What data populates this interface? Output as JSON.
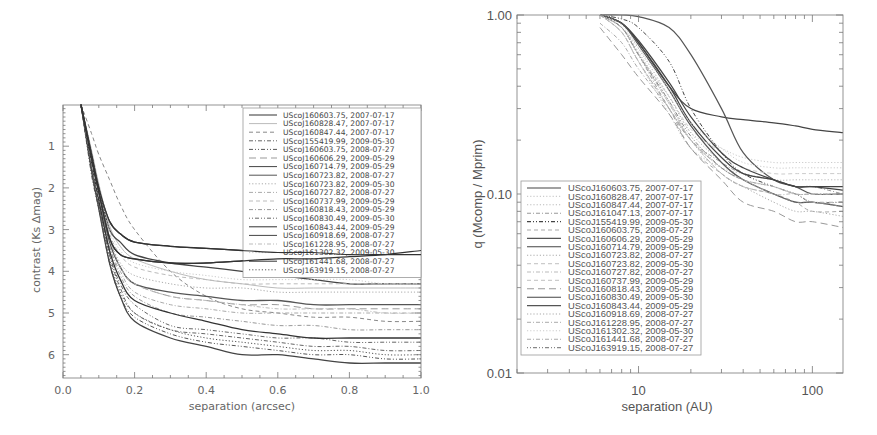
{
  "chart_data": [
    {
      "type": "line",
      "title": "",
      "xlabel": "separation (arcsec)",
      "ylabel": "contrast (Ks Δmag)",
      "xlim": [
        0.0,
        1.0
      ],
      "ylim": [
        6.5,
        0.0
      ],
      "y_inverted": true,
      "xticks": [
        "0.0",
        "0.2",
        "0.4",
        "0.6",
        "0.8",
        "1.0"
      ],
      "yticks": [
        "1",
        "2",
        "3",
        "4",
        "5",
        "6"
      ],
      "legend_position": "upper right",
      "x": [
        0.05,
        0.08,
        0.1,
        0.13,
        0.16,
        0.2,
        0.3,
        0.4,
        0.5,
        0.6,
        0.7,
        0.8,
        0.9,
        1.0
      ],
      "series": [
        {
          "name": "UScoJ160603.75, 2007-07-17",
          "style": "solid",
          "color": "#333333",
          "values": [
            0.0,
            1.2,
            2.0,
            2.8,
            3.1,
            3.3,
            3.4,
            3.45,
            3.5,
            3.55,
            3.55,
            3.6,
            3.6,
            3.6
          ]
        },
        {
          "name": "UScoJ160828.47, 2007-07-17",
          "style": "solid-light",
          "color": "#bbbbbb",
          "values": [
            0.0,
            1.1,
            1.9,
            2.9,
            3.4,
            3.7,
            4.0,
            4.2,
            4.3,
            4.4,
            4.4,
            4.4,
            4.4,
            4.4
          ]
        },
        {
          "name": "UScoJ160847.44, 2007-07-17",
          "style": "dashed",
          "color": "#888888",
          "values": [
            0.0,
            0.7,
            1.2,
            1.8,
            2.4,
            3.0,
            4.0,
            4.6,
            4.9,
            5.0,
            5.1,
            5.1,
            5.2,
            5.2
          ]
        },
        {
          "name": "UScoJ155419.99, 2009-05-30",
          "style": "dash-dot",
          "color": "#666666",
          "values": [
            0.0,
            1.6,
            2.4,
            3.6,
            4.4,
            5.0,
            5.4,
            5.5,
            5.6,
            5.7,
            5.8,
            5.8,
            5.9,
            5.9
          ]
        },
        {
          "name": "UScoJ160603.75, 2008-07-27",
          "style": "dash-dot-dot",
          "color": "#555555",
          "values": [
            0.0,
            1.7,
            2.5,
            3.8,
            4.6,
            5.1,
            5.5,
            5.7,
            5.8,
            5.9,
            6.0,
            6.0,
            6.1,
            6.1
          ]
        },
        {
          "name": "UScoJ160606.29, 2009-05-29",
          "style": "long-dash",
          "color": "#999999",
          "values": [
            0.0,
            1.3,
            2.1,
            3.2,
            3.9,
            4.3,
            4.6,
            4.7,
            4.8,
            4.8,
            4.9,
            4.9,
            4.9,
            4.9
          ]
        },
        {
          "name": "UScoJ160714.79, 2009-05-29",
          "style": "solid",
          "color": "#444444",
          "values": [
            0.0,
            1.2,
            2.0,
            3.0,
            3.3,
            3.6,
            3.8,
            3.9,
            4.0,
            4.1,
            4.2,
            4.3,
            4.3,
            4.3
          ]
        },
        {
          "name": "UScoJ160723.82, 2008-07-27",
          "style": "solid",
          "color": "#555555",
          "values": [
            0.0,
            1.3,
            2.2,
            3.3,
            3.9,
            4.3,
            4.5,
            4.6,
            4.7,
            4.7,
            4.8,
            4.8,
            4.8,
            4.8
          ]
        },
        {
          "name": "UScoJ160723.82, 2009-05-30",
          "style": "dotted",
          "color": "#aaaaaa",
          "values": [
            0.0,
            1.3,
            2.2,
            3.2,
            3.8,
            4.1,
            4.3,
            4.4,
            4.4,
            4.5,
            4.5,
            4.5,
            4.5,
            4.5
          ]
        },
        {
          "name": "UScoJ160727.82, 2008-07-27",
          "style": "dash-dot",
          "color": "#aaaaaa",
          "values": [
            0.0,
            1.4,
            2.3,
            3.4,
            4.0,
            4.5,
            4.8,
            4.9,
            5.0,
            5.0,
            5.0,
            5.0,
            5.0,
            5.0
          ]
        },
        {
          "name": "UScoJ160737.99, 2009-05-29",
          "style": "dashed",
          "color": "#bbbbbb",
          "values": [
            0.0,
            1.3,
            2.1,
            3.1,
            3.6,
            3.9,
            4.1,
            4.2,
            4.3,
            4.3,
            4.3,
            4.3,
            4.3,
            4.3
          ]
        },
        {
          "name": "UScoJ160818.43, 2009-05-29",
          "style": "dash-dot",
          "color": "#999999",
          "values": [
            0.0,
            1.4,
            2.3,
            3.4,
            4.1,
            4.6,
            5.0,
            5.1,
            5.2,
            5.3,
            5.3,
            5.4,
            5.4,
            5.4
          ]
        },
        {
          "name": "UScoJ160830.49, 2009-05-30",
          "style": "dotted-dashed",
          "color": "#666666",
          "values": [
            0.0,
            1.5,
            2.4,
            3.6,
            4.3,
            4.8,
            5.3,
            5.4,
            5.5,
            5.6,
            5.6,
            5.7,
            5.7,
            5.7
          ]
        },
        {
          "name": "UScoJ160843.44, 2009-05-29",
          "style": "solid",
          "color": "#333333",
          "values": [
            0.0,
            1.4,
            2.3,
            3.5,
            4.2,
            4.7,
            5.0,
            5.2,
            5.4,
            5.5,
            5.6,
            5.6,
            5.6,
            5.6
          ]
        },
        {
          "name": "UScoJ160918.69, 2008-07-27",
          "style": "solid",
          "color": "#444444",
          "values": [
            0.0,
            1.6,
            2.5,
            3.8,
            4.6,
            5.2,
            5.6,
            5.8,
            6.0,
            6.0,
            6.1,
            6.2,
            6.2,
            6.2
          ]
        },
        {
          "name": "UScoJ161228.95, 2008-07-27",
          "style": "dash-dot",
          "color": "#bbbbbb",
          "values": [
            0.0,
            1.4,
            2.2,
            3.2,
            3.9,
            4.3,
            4.6,
            4.7,
            4.8,
            4.9,
            4.9,
            4.9,
            5.0,
            5.0
          ]
        },
        {
          "name": "UScoJ161302.32, 2009-05-30",
          "style": "dotted",
          "color": "#cccccc",
          "values": [
            0.0,
            1.2,
            2.0,
            3.0,
            3.5,
            3.8,
            4.0,
            4.1,
            4.2,
            4.2,
            4.2,
            4.2,
            4.3,
            4.3
          ]
        },
        {
          "name": "UScoJ161441.68, 2008-07-27",
          "style": "solid",
          "color": "#333333",
          "values": [
            0.0,
            1.3,
            2.1,
            3.2,
            3.6,
            3.7,
            3.8,
            3.8,
            3.75,
            3.7,
            3.7,
            3.65,
            3.6,
            3.5
          ]
        },
        {
          "name": "UScoJ163919.15, 2008-07-27",
          "style": "dotted",
          "color": "#555555",
          "values": [
            0.0,
            1.6,
            2.5,
            3.7,
            4.5,
            5.0,
            5.4,
            5.6,
            5.7,
            5.8,
            5.9,
            5.9,
            6.0,
            6.0
          ]
        }
      ]
    },
    {
      "type": "line",
      "title": "",
      "xlabel": "separation (AU)",
      "ylabel": "q (Mcomp / Mprim)",
      "xscale": "log",
      "yscale": "log",
      "xlim": [
        2,
        150
      ],
      "ylim": [
        0.01,
        1.0
      ],
      "xticks": [
        "10",
        "100"
      ],
      "yticks": [
        "0.01",
        "0.10",
        "1.00"
      ],
      "legend_position": "lower left",
      "x": [
        6,
        8,
        10,
        15,
        20,
        30,
        40,
        60,
        80,
        100,
        150
      ],
      "series": [
        {
          "name": "UScoJ160603.75, 2007-07-17",
          "style": "solid",
          "color": "#444444",
          "values": [
            1.0,
            0.9,
            0.7,
            0.4,
            0.3,
            0.27,
            0.26,
            0.25,
            0.24,
            0.23,
            0.22
          ]
        },
        {
          "name": "UScoJ160828.47, 2007-07-17",
          "style": "dotted",
          "color": "#cccccc",
          "values": [
            1.0,
            0.85,
            0.6,
            0.35,
            0.22,
            0.18,
            0.16,
            0.15,
            0.15,
            0.15,
            0.15
          ]
        },
        {
          "name": "UScoJ160847.44, 2007-07-17",
          "style": "dotted",
          "color": "#bbbbbb",
          "values": [
            1.0,
            0.8,
            0.55,
            0.28,
            0.18,
            0.14,
            0.13,
            0.12,
            0.12,
            0.12,
            0.12
          ]
        },
        {
          "name": "UScoJ161047.13, 2007-07-17",
          "style": "dash-dot",
          "color": "#999999",
          "values": [
            1.0,
            0.85,
            0.6,
            0.3,
            0.2,
            0.15,
            0.13,
            0.12,
            0.11,
            0.11,
            0.1
          ]
        },
        {
          "name": "UScoJ155419.99, 2009-05-30",
          "style": "dash-dot-dot",
          "color": "#444444",
          "values": [
            1.0,
            0.95,
            0.85,
            0.55,
            0.3,
            0.17,
            0.13,
            0.11,
            0.1,
            0.09,
            0.09
          ]
        },
        {
          "name": "UScoJ160603.75, 2008-07-27",
          "style": "dashed",
          "color": "#aaaaaa",
          "values": [
            1.0,
            0.8,
            0.55,
            0.3,
            0.18,
            0.13,
            0.11,
            0.1,
            0.09,
            0.08,
            0.08
          ]
        },
        {
          "name": "UScoJ160606.29, 2009-05-29",
          "style": "solid",
          "color": "#555555",
          "values": [
            1.0,
            1.0,
            0.98,
            0.85,
            0.6,
            0.3,
            0.17,
            0.12,
            0.11,
            0.1,
            0.1
          ]
        },
        {
          "name": "UScoJ160714.79, 2009-05-29",
          "style": "solid",
          "color": "#444444",
          "values": [
            1.0,
            0.9,
            0.7,
            0.4,
            0.25,
            0.16,
            0.13,
            0.12,
            0.11,
            0.11,
            0.11
          ]
        },
        {
          "name": "UScoJ160723.82, 2008-07-27",
          "style": "dotted",
          "color": "#aaaaaa",
          "values": [
            1.0,
            0.85,
            0.65,
            0.35,
            0.22,
            0.15,
            0.12,
            0.11,
            0.1,
            0.1,
            0.1
          ]
        },
        {
          "name": "UScoJ160723.82, 2009-05-30",
          "style": "dashed",
          "color": "#cccccc",
          "values": [
            1.0,
            0.85,
            0.6,
            0.32,
            0.2,
            0.14,
            0.12,
            0.11,
            0.1,
            0.1,
            0.1
          ]
        },
        {
          "name": "UScoJ160727.82, 2008-07-27",
          "style": "dash-dot",
          "color": "#bbbbbb",
          "values": [
            1.0,
            0.8,
            0.55,
            0.3,
            0.2,
            0.13,
            0.11,
            0.1,
            0.09,
            0.09,
            0.09
          ]
        },
        {
          "name": "UScoJ160737.99, 2009-05-29",
          "style": "dashed",
          "color": "#cccccc",
          "values": [
            1.0,
            0.85,
            0.6,
            0.35,
            0.23,
            0.17,
            0.14,
            0.13,
            0.13,
            0.13,
            0.13
          ]
        },
        {
          "name": "UScoJ160818.43, 2009-05-29",
          "style": "long-dash",
          "color": "#999999",
          "values": [
            0.85,
            0.6,
            0.45,
            0.28,
            0.18,
            0.12,
            0.09,
            0.08,
            0.07,
            0.07,
            0.065
          ]
        },
        {
          "name": "UScoJ160830.49, 2009-05-30",
          "style": "solid",
          "color": "#444444",
          "values": [
            1.0,
            0.9,
            0.72,
            0.42,
            0.27,
            0.17,
            0.14,
            0.12,
            0.11,
            0.11,
            0.105
          ]
        },
        {
          "name": "UScoJ160843.44, 2009-05-29",
          "style": "solid",
          "color": "#555555",
          "values": [
            1.0,
            0.9,
            0.68,
            0.38,
            0.24,
            0.15,
            0.12,
            0.1,
            0.09,
            0.09,
            0.085
          ]
        },
        {
          "name": "UScoJ160918.69, 2008-07-27",
          "style": "dotted",
          "color": "#aaaaaa",
          "values": [
            1.0,
            0.85,
            0.62,
            0.33,
            0.2,
            0.13,
            0.11,
            0.09,
            0.08,
            0.08,
            0.075
          ]
        },
        {
          "name": "UScoJ161228.95, 2008-07-27",
          "style": "dash-dot",
          "color": "#bbbbbb",
          "values": [
            1.0,
            0.85,
            0.6,
            0.32,
            0.2,
            0.14,
            0.12,
            0.1,
            0.1,
            0.09,
            0.09
          ]
        },
        {
          "name": "UScoJ161302.32, 2009-05-30",
          "style": "dotted",
          "color": "#cccccc",
          "values": [
            1.0,
            0.88,
            0.66,
            0.38,
            0.25,
            0.18,
            0.15,
            0.14,
            0.14,
            0.14,
            0.14
          ]
        },
        {
          "name": "UScoJ161441.68, 2008-07-27",
          "style": "dash-dot",
          "color": "#aaaaaa",
          "values": [
            0.9,
            0.7,
            0.5,
            0.3,
            0.2,
            0.14,
            0.12,
            0.11,
            0.1,
            0.1,
            0.1
          ]
        },
        {
          "name": "UScoJ163919.15, 2008-07-27",
          "style": "dotted-dashed",
          "color": "#888888",
          "values": [
            1.0,
            0.85,
            0.6,
            0.33,
            0.21,
            0.14,
            0.12,
            0.1,
            0.09,
            0.09,
            0.085
          ]
        }
      ]
    }
  ],
  "left_chart": {
    "xlabel": "separation (arcsec)",
    "ylabel": "contrast (Ks Δmag)",
    "xticks": [
      "0.0",
      "0.2",
      "0.4",
      "0.6",
      "0.8",
      "1.0"
    ],
    "yticks": [
      "1",
      "2",
      "3",
      "4",
      "5",
      "6"
    ]
  },
  "right_chart": {
    "xlabel": "separation (AU)",
    "ylabel": "q (Mcomp / Mprim)",
    "xticks": [
      "10",
      "100"
    ],
    "yticks": [
      "1.00",
      "0.10",
      "0.01"
    ]
  }
}
